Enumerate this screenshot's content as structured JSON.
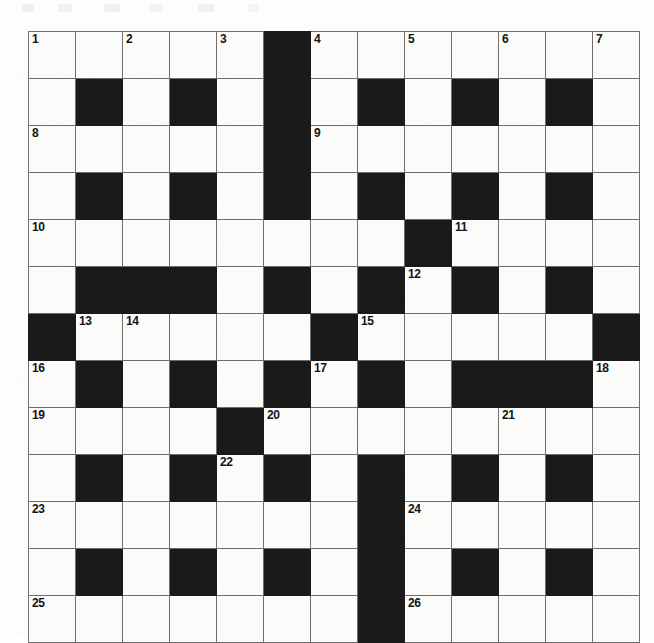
{
  "puzzle": {
    "kind": "crossword-grid",
    "rows": 13,
    "columns": 13,
    "cell_size_px": 46,
    "grid_origin": {
      "x": 28,
      "y": 31
    },
    "colors": {
      "page_background": "#fdfdfc",
      "cell_fill": "#fbfbfa",
      "block_fill": "#1a1a1a",
      "grid_line": "#6e6e6e",
      "number_text": "#131313"
    },
    "legend": {
      "block": "black / shaded square (no letter)",
      "open": "white square (letter goes here)"
    },
    "layout_note": "1 = black block, 0 = open white square; rows listed top to bottom, columns left to right",
    "grid": [
      [
        0,
        0,
        0,
        0,
        0,
        1,
        0,
        0,
        0,
        0,
        0,
        0,
        0
      ],
      [
        0,
        1,
        0,
        1,
        0,
        1,
        0,
        1,
        0,
        1,
        0,
        1,
        0
      ],
      [
        0,
        0,
        0,
        0,
        0,
        1,
        0,
        0,
        0,
        0,
        0,
        0,
        0
      ],
      [
        0,
        1,
        0,
        1,
        0,
        1,
        0,
        1,
        0,
        1,
        0,
        1,
        0
      ],
      [
        0,
        0,
        0,
        0,
        0,
        0,
        0,
        0,
        1,
        0,
        0,
        0,
        0
      ],
      [
        0,
        1,
        1,
        1,
        0,
        1,
        0,
        1,
        0,
        1,
        0,
        1,
        0
      ],
      [
        1,
        0,
        0,
        0,
        0,
        0,
        1,
        0,
        0,
        0,
        0,
        0,
        1
      ],
      [
        0,
        1,
        0,
        1,
        0,
        1,
        0,
        1,
        0,
        1,
        1,
        1,
        0
      ],
      [
        0,
        0,
        0,
        0,
        1,
        0,
        0,
        0,
        0,
        0,
        0,
        0,
        0
      ],
      [
        0,
        1,
        0,
        1,
        0,
        1,
        0,
        1,
        0,
        1,
        0,
        1,
        0
      ],
      [
        0,
        0,
        0,
        0,
        0,
        0,
        0,
        1,
        0,
        0,
        0,
        0,
        0
      ],
      [
        0,
        1,
        0,
        1,
        0,
        1,
        0,
        1,
        0,
        1,
        0,
        1,
        0
      ],
      [
        0,
        0,
        0,
        0,
        0,
        0,
        0,
        1,
        0,
        0,
        0,
        0,
        0
      ]
    ],
    "numbers": [
      {
        "n": "1",
        "row": 1,
        "col": 1
      },
      {
        "n": "2",
        "row": 1,
        "col": 3
      },
      {
        "n": "3",
        "row": 1,
        "col": 5
      },
      {
        "n": "4",
        "row": 1,
        "col": 7
      },
      {
        "n": "5",
        "row": 1,
        "col": 9
      },
      {
        "n": "6",
        "row": 1,
        "col": 11
      },
      {
        "n": "7",
        "row": 1,
        "col": 13
      },
      {
        "n": "8",
        "row": 3,
        "col": 1
      },
      {
        "n": "9",
        "row": 3,
        "col": 7
      },
      {
        "n": "10",
        "row": 5,
        "col": 1
      },
      {
        "n": "11",
        "row": 5,
        "col": 10
      },
      {
        "n": "12",
        "row": 6,
        "col": 9
      },
      {
        "n": "13",
        "row": 7,
        "col": 2
      },
      {
        "n": "14",
        "row": 7,
        "col": 3
      },
      {
        "n": "15",
        "row": 7,
        "col": 8
      },
      {
        "n": "16",
        "row": 8,
        "col": 1
      },
      {
        "n": "17",
        "row": 8,
        "col": 7
      },
      {
        "n": "18",
        "row": 8,
        "col": 13
      },
      {
        "n": "19",
        "row": 9,
        "col": 1
      },
      {
        "n": "20",
        "row": 9,
        "col": 6
      },
      {
        "n": "21",
        "row": 9,
        "col": 11
      },
      {
        "n": "22",
        "row": 10,
        "col": 5
      },
      {
        "n": "23",
        "row": 11,
        "col": 1
      },
      {
        "n": "24",
        "row": 11,
        "col": 9
      },
      {
        "n": "25",
        "row": 13,
        "col": 1
      },
      {
        "n": "26",
        "row": 13,
        "col": 9
      }
    ]
  }
}
